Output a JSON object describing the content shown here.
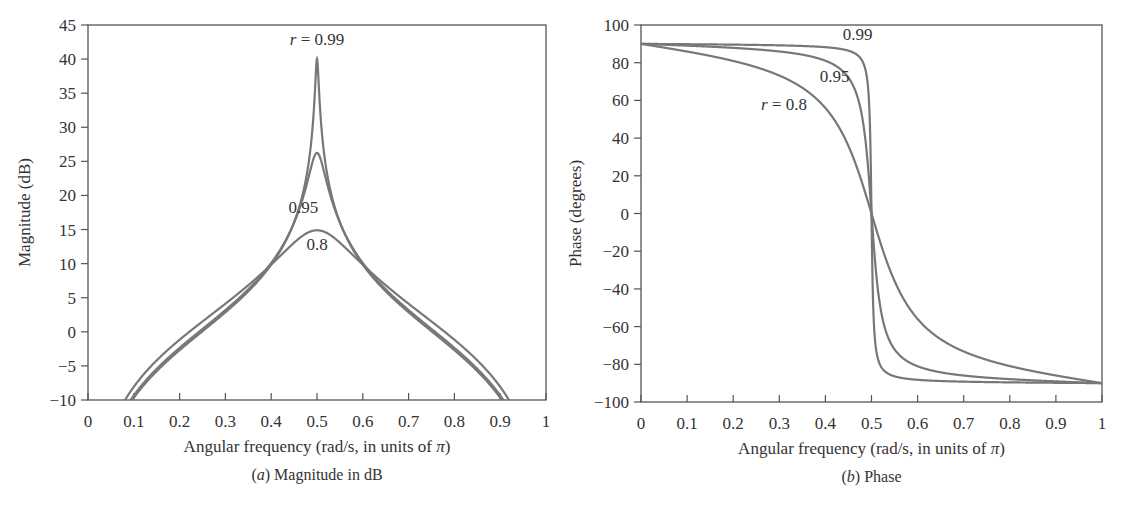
{
  "chart_data": [
    {
      "type": "line",
      "panel": "a",
      "caption_prefix": "(a)",
      "caption_text": " Magnitude in dB",
      "title": "",
      "xlabel": "Angular frequency (rad/s, in units of π)",
      "ylabel": "Magnitude (dB)",
      "xlim": [
        0,
        1
      ],
      "ylim": [
        -10,
        45
      ],
      "xticks": [
        "0",
        "0.1",
        "0.2",
        "0.3",
        "0.4",
        "0.5",
        "0.6",
        "0.7",
        "0.8",
        "0.9",
        "1"
      ],
      "yticks": [
        "−10",
        "−5",
        "0",
        "5",
        "10",
        "15",
        "20",
        "25",
        "30",
        "35",
        "40",
        "45"
      ],
      "ytick_values": [
        -10,
        -5,
        0,
        5,
        10,
        15,
        20,
        25,
        30,
        35,
        40,
        45
      ],
      "grid": false,
      "x": [
        0.1,
        0.2,
        0.3,
        0.4,
        0.5,
        0.6,
        0.7,
        0.8,
        0.9
      ],
      "series": [
        {
          "name": "r = 0.99",
          "r": 0.99,
          "values": [
            -9.7,
            -2.7,
            2.9,
            9.9,
            40.0,
            9.9,
            2.9,
            -2.7,
            -9.7
          ]
        },
        {
          "name": "r = 0.95",
          "r": 0.95,
          "values": [
            -9.3,
            -2.3,
            3.2,
            10.1,
            26.2,
            10.1,
            3.2,
            -2.3,
            -9.3
          ]
        },
        {
          "name": "r = 0.8",
          "r": 0.8,
          "values": [
            -8.1,
            -1.2,
            4.1,
            9.9,
            14.9,
            9.9,
            4.1,
            -1.2,
            -8.1
          ]
        }
      ],
      "annotations": [
        {
          "text": "r = 0.99",
          "italic_prefix": "r",
          "rest": " = 0.99",
          "x": 0.5,
          "y": 42
        },
        {
          "text": "0.95",
          "x": 0.47,
          "y": 17.5
        },
        {
          "text": "0.8",
          "x": 0.5,
          "y": 12
        }
      ]
    },
    {
      "type": "line",
      "panel": "b",
      "caption_prefix": "(b)",
      "caption_text": " Phase",
      "title": "",
      "xlabel": "Angular frequency (rad/s, in units of π)",
      "ylabel": "Phase (degrees)",
      "xlim": [
        0,
        1
      ],
      "ylim": [
        -100,
        100
      ],
      "xticks": [
        "0",
        "0.1",
        "0.2",
        "0.3",
        "0.4",
        "0.5",
        "0.6",
        "0.7",
        "0.8",
        "0.9",
        "1"
      ],
      "yticks": [
        "−100",
        "−80",
        "−60",
        "−40",
        "−20",
        "0",
        "20",
        "40",
        "60",
        "80",
        "100"
      ],
      "ytick_values": [
        -100,
        -80,
        -60,
        -40,
        -20,
        0,
        20,
        40,
        60,
        80,
        100
      ],
      "grid": false,
      "x": [
        0,
        0.1,
        0.2,
        0.3,
        0.4,
        0.45,
        0.5,
        0.55,
        0.6,
        0.7,
        0.8,
        0.9,
        1
      ],
      "series": [
        {
          "name": "r = 0.99",
          "r": 0.99,
          "values": [
            90,
            89.7,
            89.3,
            88.3,
            86.5,
            83.0,
            0,
            -83.0,
            -86.5,
            -88.3,
            -89.3,
            -89.7,
            -90
          ]
        },
        {
          "name": "r = 0.95",
          "r": 0.95,
          "values": [
            90,
            88.7,
            86.8,
            83.4,
            74.7,
            61.5,
            0,
            -61.5,
            -74.7,
            -83.4,
            -86.8,
            -88.7,
            -90
          ]
        },
        {
          "name": "r = 0.8",
          "r": 0.8,
          "values": [
            90,
            86.4,
            81.6,
            73.3,
            52.1,
            30.1,
            0,
            -30.1,
            -52.1,
            -73.3,
            -81.6,
            -86.4,
            -90
          ]
        }
      ],
      "annotations": [
        {
          "text": "0.99",
          "x": 0.47,
          "y": 92
        },
        {
          "text": "0.95",
          "x": 0.42,
          "y": 70
        },
        {
          "text": "r = 0.8",
          "italic_prefix": "r",
          "rest": " = 0.8",
          "x": 0.31,
          "y": 55
        }
      ]
    }
  ],
  "style": {
    "line_color": "#777777",
    "axis_color": "#555555"
  }
}
